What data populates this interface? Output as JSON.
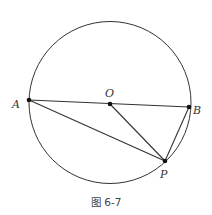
{
  "figure": {
    "caption": "图 6-7",
    "circle": {
      "cx": 110,
      "cy": 102.5,
      "r": 81,
      "stroke": "#333333"
    },
    "points": {
      "A": {
        "label": "A",
        "x": 29,
        "y": 100
      },
      "O": {
        "label": "O",
        "x": 110,
        "y": 104
      },
      "B": {
        "label": "B",
        "x": 189,
        "y": 107
      },
      "P": {
        "label": "P",
        "x": 165,
        "y": 161
      }
    },
    "segments": [
      "AB",
      "AP",
      "OP",
      "BP"
    ]
  }
}
